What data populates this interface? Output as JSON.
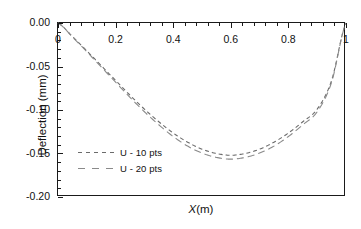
{
  "chart_data": {
    "type": "line",
    "title": "",
    "xlabel": "X(m)",
    "ylabel": "Deflection (mm)",
    "xlim": [
      0,
      1
    ],
    "ylim": [
      -0.2,
      0.0
    ],
    "xticks": [
      0,
      0.2,
      0.4,
      0.6,
      0.8,
      1
    ],
    "xticklabels": [
      "0",
      "0.2",
      "0.4",
      "0.6",
      "0.8",
      "1"
    ],
    "yticks": [
      0.0,
      -0.05,
      -0.1,
      -0.15,
      -0.2
    ],
    "yticklabels": [
      "0.00",
      "-0.05",
      "-0.10",
      "-0.15",
      "-0.20"
    ],
    "x_minor_ticks_per_major": 4,
    "y_minor_ticks_per_major": 4,
    "grid": false,
    "x_tick_labels_position": "inside-top",
    "y_tick_labels_position": "outside-left",
    "legend": {
      "position": "inside-lower-left",
      "entries": [
        {
          "name": "U - 10 pts",
          "color": "#6b6b6b",
          "dash": "short-dash"
        },
        {
          "name": "U - 20 pts",
          "color": "#8a8a8a",
          "dash": "long-dash"
        }
      ]
    },
    "series": [
      {
        "name": "U - 10 pts",
        "color": "#6b6b6b",
        "dash": "short-dash",
        "x": [
          0.0,
          0.05,
          0.1,
          0.15,
          0.2,
          0.25,
          0.3,
          0.35,
          0.4,
          0.45,
          0.5,
          0.55,
          0.6,
          0.65,
          0.7,
          0.75,
          0.8,
          0.85,
          0.9,
          0.95,
          1.0
        ],
        "values": [
          0.0,
          -0.0155,
          -0.032,
          -0.049,
          -0.066,
          -0.083,
          -0.099,
          -0.1135,
          -0.1265,
          -0.137,
          -0.145,
          -0.15,
          -0.152,
          -0.15,
          -0.145,
          -0.137,
          -0.1265,
          -0.1135,
          -0.099,
          -0.066,
          0.0
        ]
      },
      {
        "name": "U - 20 pts",
        "color": "#8a8a8a",
        "dash": "long-dash",
        "x": [
          0.0,
          0.05,
          0.1,
          0.15,
          0.2,
          0.25,
          0.3,
          0.35,
          0.4,
          0.45,
          0.5,
          0.55,
          0.6,
          0.65,
          0.7,
          0.75,
          0.8,
          0.85,
          0.9,
          0.95,
          1.0
        ],
        "values": [
          0.0,
          -0.016,
          -0.033,
          -0.0505,
          -0.068,
          -0.0855,
          -0.102,
          -0.117,
          -0.1305,
          -0.1415,
          -0.1495,
          -0.1545,
          -0.1565,
          -0.1545,
          -0.1495,
          -0.1415,
          -0.1305,
          -0.117,
          -0.102,
          -0.068,
          0.0
        ]
      }
    ],
    "minimum_10pts": {
      "x": 0.5,
      "y": -0.175
    },
    "minimum_20pts": {
      "x": 0.5,
      "y": -0.182
    },
    "axis_color": "#1a1a1a"
  }
}
